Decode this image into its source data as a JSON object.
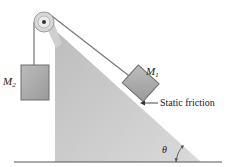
{
  "diagram": {
    "labels": {
      "mass2": "M",
      "mass2_sub": "2",
      "mass1": "M",
      "mass1_sub": "1",
      "friction": "Static friction",
      "angle": "θ"
    },
    "colors": {
      "incline_fill": "#c8c8c8",
      "block_fill": "#a9a9a9",
      "block_stroke": "#6e6e6e",
      "line": "#555555",
      "ground": "#555555",
      "pulley": "#b5b5b5"
    }
  }
}
